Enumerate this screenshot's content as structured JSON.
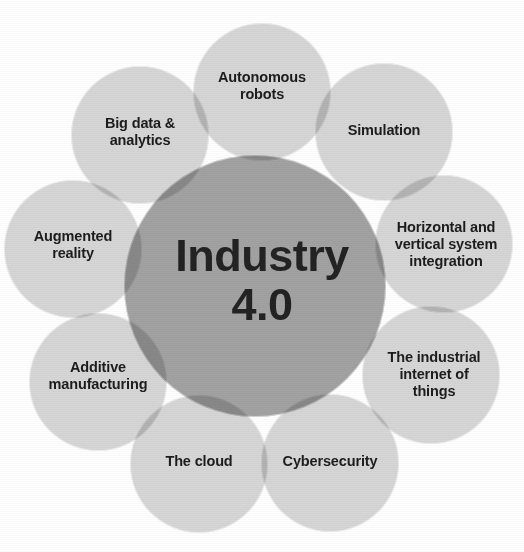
{
  "diagram": {
    "type": "petal-venn",
    "title": "Industry 4.0",
    "core": {
      "label": "Industry\n4.0",
      "line1": "Industry",
      "line2": "4.0",
      "color": "#a2a2a2",
      "center_x": 255,
      "center_y": 286,
      "radius": 131
    },
    "background_color": "#ffffff",
    "petal_color": "#d6d6d6",
    "text_color": "#1d1d1d",
    "petal_radius": 69,
    "orbit_radius": 188,
    "petals": [
      {
        "id": "autonomous-robots",
        "label": "Autonomous\nrobots",
        "angle_deg": 270,
        "center_x": 262,
        "center_y": 92,
        "label_x": 262,
        "label_y": 86
      },
      {
        "id": "simulation",
        "label": "Simulation",
        "angle_deg": 310,
        "center_x": 384,
        "center_y": 132,
        "label_x": 384,
        "label_y": 130
      },
      {
        "id": "horizontal-vertical-system-integration",
        "label": "Horizontal and\nvertical system\nintegration",
        "angle_deg": 350,
        "center_x": 444,
        "center_y": 244,
        "label_x": 446,
        "label_y": 244
      },
      {
        "id": "industrial-internet-of-things",
        "label": "The industrial\ninternet of\nthings",
        "angle_deg": 30,
        "center_x": 431,
        "center_y": 375,
        "label_x": 434,
        "label_y": 374
      },
      {
        "id": "cybersecurity",
        "label": "Cybersecurity",
        "angle_deg": 65,
        "center_x": 330,
        "center_y": 463,
        "label_x": 330,
        "label_y": 461
      },
      {
        "id": "the-cloud",
        "label": "The cloud",
        "angle_deg": 100,
        "center_x": 199,
        "center_y": 464,
        "label_x": 199,
        "label_y": 461
      },
      {
        "id": "additive-manufacturing",
        "label": "Additive\nmanufacturing",
        "angle_deg": 140,
        "center_x": 98,
        "center_y": 382,
        "label_x": 98,
        "label_y": 376
      },
      {
        "id": "augmented-reality",
        "label": "Augmented\nreality",
        "angle_deg": 185,
        "center_x": 73,
        "center_y": 249,
        "label_x": 73,
        "label_y": 245
      },
      {
        "id": "big-data-analytics",
        "label": "Big data &\nanalytics",
        "angle_deg": 225,
        "center_x": 140,
        "center_y": 135,
        "label_x": 140,
        "label_y": 132
      }
    ]
  }
}
